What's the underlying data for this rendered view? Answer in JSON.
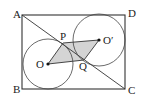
{
  "diagram": {
    "type": "geometry",
    "labels": {
      "A": "A",
      "B": "B",
      "C": "C",
      "D": "D",
      "O": "O",
      "O_prime": "O′",
      "P": "P",
      "Q": "Q"
    },
    "colors": {
      "stroke": "#333333",
      "shade": "#d4d4d4",
      "background": "#ffffff"
    },
    "points": {
      "A": [
        22,
        15
      ],
      "B": [
        22,
        89
      ],
      "C": [
        125,
        89
      ],
      "D": [
        125,
        15
      ],
      "O": [
        48,
        64
      ],
      "O_prime": [
        99,
        40
      ],
      "P": [
        63,
        43
      ],
      "Q": [
        84,
        60
      ]
    },
    "circles": [
      {
        "name": "circle-O",
        "center": "O",
        "r": 25
      },
      {
        "name": "circle-O-prime",
        "center": "O_prime",
        "r": 26
      }
    ]
  }
}
